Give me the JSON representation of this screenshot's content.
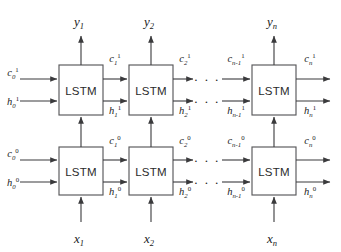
{
  "figure": {
    "stroke_color": "#3a3a3c",
    "box_stroke_color": "#58585a",
    "background_color": "#ffffff",
    "text_color": "#1a1a1a"
  },
  "cells": {
    "label": "LSTM",
    "upper_layer_superscript": "1",
    "lower_layer_superscript": "0",
    "timesteps": [
      {
        "index": "1",
        "x_input": "x",
        "y_output": "y"
      },
      {
        "index": "2",
        "x_input": "x",
        "y_output": "y"
      },
      {
        "index": "n",
        "x_input": "x",
        "y_output": "y"
      }
    ]
  },
  "upper_row": {
    "layer_superscript": "1",
    "cell_label": "LSTM",
    "cells": [
      {
        "name": "lstm-upper-t1",
        "label": "LSTM"
      },
      {
        "name": "lstm-upper-t2",
        "label": "LSTM"
      },
      {
        "name": "lstm-upper-tn",
        "label": "LSTM"
      }
    ],
    "c_labels": [
      {
        "base": "c",
        "sub": "0",
        "sup": "1"
      },
      {
        "base": "c",
        "sub": "1",
        "sup": "1"
      },
      {
        "base": "c",
        "sub": "2",
        "sup": "1"
      },
      {
        "base": "c",
        "sub": "n-1",
        "sup": "1"
      },
      {
        "base": "c",
        "sub": "n",
        "sup": "1"
      }
    ],
    "h_labels": [
      {
        "base": "h",
        "sub": "0",
        "sup": "1"
      },
      {
        "base": "h",
        "sub": "1",
        "sup": "1"
      },
      {
        "base": "h",
        "sub": "2",
        "sup": "1"
      },
      {
        "base": "h",
        "sub": "n-1",
        "sup": "1"
      },
      {
        "base": "h",
        "sub": "n",
        "sup": "1"
      }
    ]
  },
  "lower_row": {
    "layer_superscript": "0",
    "cell_label": "LSTM",
    "cells": [
      {
        "name": "lstm-lower-t1",
        "label": "LSTM"
      },
      {
        "name": "lstm-lower-t2",
        "label": "LSTM"
      },
      {
        "name": "lstm-lower-tn",
        "label": "LSTM"
      }
    ],
    "c_labels": [
      {
        "base": "c",
        "sub": "0",
        "sup": "0"
      },
      {
        "base": "c",
        "sub": "1",
        "sup": "0"
      },
      {
        "base": "c",
        "sub": "2",
        "sup": "0"
      },
      {
        "base": "c",
        "sub": "n-1",
        "sup": "0"
      },
      {
        "base": "c",
        "sub": "n",
        "sup": "0"
      }
    ],
    "h_labels": [
      {
        "base": "h",
        "sub": "0",
        "sup": "0"
      },
      {
        "base": "h",
        "sub": "1",
        "sup": "0"
      },
      {
        "base": "h",
        "sub": "2",
        "sup": "0"
      },
      {
        "base": "h",
        "sub": "n-1",
        "sup": "0"
      },
      {
        "base": "h",
        "sub": "n",
        "sup": "0"
      }
    ]
  },
  "outputs": [
    {
      "base": "y",
      "sub": "1"
    },
    {
      "base": "y",
      "sub": "2"
    },
    {
      "base": "y",
      "sub": "n"
    }
  ],
  "inputs": [
    {
      "base": "x",
      "sub": "1"
    },
    {
      "base": "x",
      "sub": "2"
    },
    {
      "base": "x",
      "sub": "n"
    }
  ],
  "ellipsis": {
    "glyph": "· · ·",
    "count": 4
  }
}
